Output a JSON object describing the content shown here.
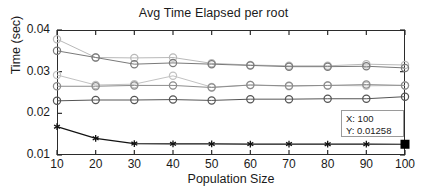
{
  "chart_data": {
    "type": "line",
    "title": "Avg Time Elapsed per root",
    "xlabel": "Population Size",
    "ylabel": "Time (sec)",
    "x": [
      10,
      20,
      30,
      40,
      50,
      60,
      70,
      80,
      90,
      100
    ],
    "xticklabels": [
      "10",
      "20",
      "30",
      "40",
      "50",
      "60",
      "70",
      "80",
      "90",
      "100"
    ],
    "yticklabels": [
      "0.01",
      "0.02",
      "0.03",
      "0.04"
    ],
    "yticks": [
      0.01,
      0.02,
      0.03,
      0.04
    ],
    "xlim": [
      10,
      100
    ],
    "ylim": [
      0.01,
      0.04
    ],
    "grid": false,
    "legend": "none",
    "series": [
      {
        "name": "series-1",
        "color": "#b9b9b9",
        "marker": "circle",
        "values": [
          0.0378,
          0.0334,
          0.0333,
          0.0334,
          0.032,
          0.0316,
          0.0314,
          0.0314,
          0.0318,
          0.0316
        ]
      },
      {
        "name": "series-2",
        "color": "#7a7a7a",
        "marker": "circle",
        "values": [
          0.035,
          0.0334,
          0.0318,
          0.0321,
          0.0318,
          0.0315,
          0.0312,
          0.0312,
          0.0313,
          0.0309
        ]
      },
      {
        "name": "series-3",
        "color": "#c2c2c2",
        "marker": "circle",
        "values": [
          0.0292,
          0.0268,
          0.027,
          0.029,
          0.0263,
          0.0268,
          0.0265,
          0.0267,
          0.0266,
          0.0267
        ]
      },
      {
        "name": "series-4",
        "color": "#8c8c8c",
        "marker": "circle",
        "values": [
          0.0265,
          0.0265,
          0.0267,
          0.0267,
          0.0262,
          0.0268,
          0.0266,
          0.0267,
          0.0269,
          0.0267
        ]
      },
      {
        "name": "series-5",
        "color": "#555555",
        "marker": "circle",
        "values": [
          0.023,
          0.0232,
          0.0232,
          0.0233,
          0.0231,
          0.0234,
          0.0234,
          0.0235,
          0.0235,
          0.024
        ]
      },
      {
        "name": "series-6",
        "color": "#121212",
        "marker": "asterisk",
        "values": [
          0.0168,
          0.014,
          0.01275,
          0.01268,
          0.01266,
          0.01263,
          0.01262,
          0.0126,
          0.01259,
          0.01258
        ]
      }
    ],
    "datatip": {
      "x_label": "X: 100",
      "y_label": "Y: 0.01258",
      "point_x": 100,
      "point_y": 0.01258,
      "marker_color": "#000000"
    }
  }
}
